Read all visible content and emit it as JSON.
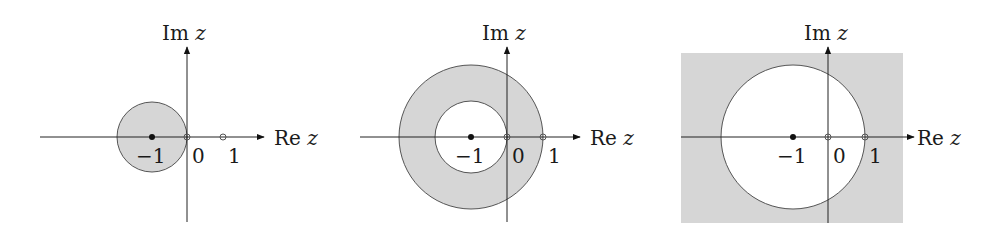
{
  "figure": {
    "colors": {
      "shade": "#d6d6d6",
      "stroke": "#555555",
      "axis": "#222222",
      "background": "#ffffff"
    }
  },
  "panels": [
    {
      "id": "panel-1",
      "region": "disk centered at -1 through origin (shaded interior)",
      "axis_labels": {
        "im": "Im",
        "im_var": "z",
        "re": "Re",
        "re_var": "z"
      },
      "ticks": {
        "neg_one": "−1",
        "zero": "0",
        "one": "1"
      },
      "points": {
        "center": "-1 (filled)",
        "origin": "0 (open)",
        "one": "1 (open)"
      }
    },
    {
      "id": "panel-2",
      "region": "annulus centered at -1, inner radius 1, outer radius 2 (shaded)",
      "axis_labels": {
        "im": "Im",
        "im_var": "z",
        "re": "Re",
        "re_var": "z"
      },
      "ticks": {
        "neg_one": "−1",
        "zero": "0",
        "one": "1"
      },
      "points": {
        "center": "-1 (filled)",
        "origin": "0 (open)",
        "one": "1 (open)"
      }
    },
    {
      "id": "panel-3",
      "region": "exterior of disk centered at -1 of radius 2 (shaded)",
      "axis_labels": {
        "im": "Im",
        "im_var": "z",
        "re": "Re",
        "re_var": "z"
      },
      "ticks": {
        "neg_one": "−1",
        "zero": "0",
        "one": "1"
      },
      "points": {
        "center": "-1 (filled)",
        "origin": "0 (open)",
        "one": "1 (open)"
      }
    }
  ]
}
